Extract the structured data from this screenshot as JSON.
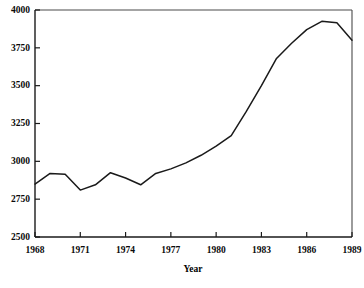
{
  "chart_data": {
    "type": "line",
    "title": "",
    "subtitle": "",
    "xlabel": "Year",
    "ylabel": "",
    "xlim": [
      1968,
      1989
    ],
    "ylim": [
      2500,
      4000
    ],
    "grid": false,
    "legend": null,
    "legend_position": "none",
    "line_color": "#1a1a1a",
    "x_tick_labels": [
      "1968",
      "1971",
      "1974",
      "1977",
      "1980",
      "1983",
      "1986",
      "1989"
    ],
    "x_tick_values": [
      1968,
      1971,
      1974,
      1977,
      1980,
      1983,
      1986,
      1989
    ],
    "y_tick_labels": [
      "2500",
      "2750",
      "3000",
      "3250",
      "3500",
      "3750",
      "4000"
    ],
    "y_tick_values": [
      2500,
      2750,
      3000,
      3250,
      3500,
      3750,
      4000
    ],
    "x": [
      1968,
      1969,
      1970,
      1971,
      1972,
      1973,
      1974,
      1975,
      1976,
      1977,
      1978,
      1979,
      1980,
      1981,
      1982,
      1983,
      1984,
      1985,
      1986,
      1987,
      1988,
      1989
    ],
    "values": [
      2850,
      2920,
      2915,
      2810,
      2845,
      2925,
      2890,
      2845,
      2920,
      2950,
      2990,
      3040,
      3100,
      3170,
      3330,
      3500,
      3680,
      3780,
      3870,
      3925,
      3915,
      3800
    ],
    "series": [
      {
        "name": "series-1",
        "values": [
          2850,
          2920,
          2915,
          2810,
          2845,
          2925,
          2890,
          2845,
          2920,
          2950,
          2990,
          3040,
          3100,
          3170,
          3330,
          3500,
          3680,
          3780,
          3870,
          3925,
          3915,
          3800
        ]
      }
    ]
  },
  "axes": {
    "x_title": "Year"
  }
}
